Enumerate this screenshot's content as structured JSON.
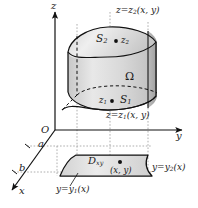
{
  "figure": {
    "axes": {
      "z_label": "z",
      "y_label": "y",
      "x_label": "x",
      "origin_label": "O"
    },
    "marks": {
      "a_label": "a",
      "b_label": "b"
    },
    "solid": {
      "region_label": "Ω",
      "top_surface_label": "S",
      "top_surface_sub": "2",
      "bottom_surface_label": "S",
      "bottom_surface_sub": "1",
      "top_point_label": "z",
      "top_point_sub": "2",
      "bottom_point_label": "z",
      "bottom_point_sub": "1",
      "top_equation": "z=z",
      "top_equation_sub": "2",
      "top_equation_args": "(x, y)",
      "bottom_equation": "z=z",
      "bottom_equation_sub": "1",
      "bottom_equation_args": "(x, y)"
    },
    "domain": {
      "label": "D",
      "label_sub": "xy",
      "point_label": "(x, y)",
      "upper_curve": "y=y",
      "upper_curve_sub": "2",
      "upper_curve_args": "(x)",
      "lower_curve": "y=y",
      "lower_curve_sub": "1",
      "lower_curve_args": "(x)"
    },
    "colors": {
      "stroke": "#111111",
      "fill_light": "#e2e2e2",
      "fill_mid": "#cfcfcf",
      "fill_dark": "#b4b4b4",
      "guide": "#9a9a9a",
      "background": "#ffffff"
    }
  }
}
